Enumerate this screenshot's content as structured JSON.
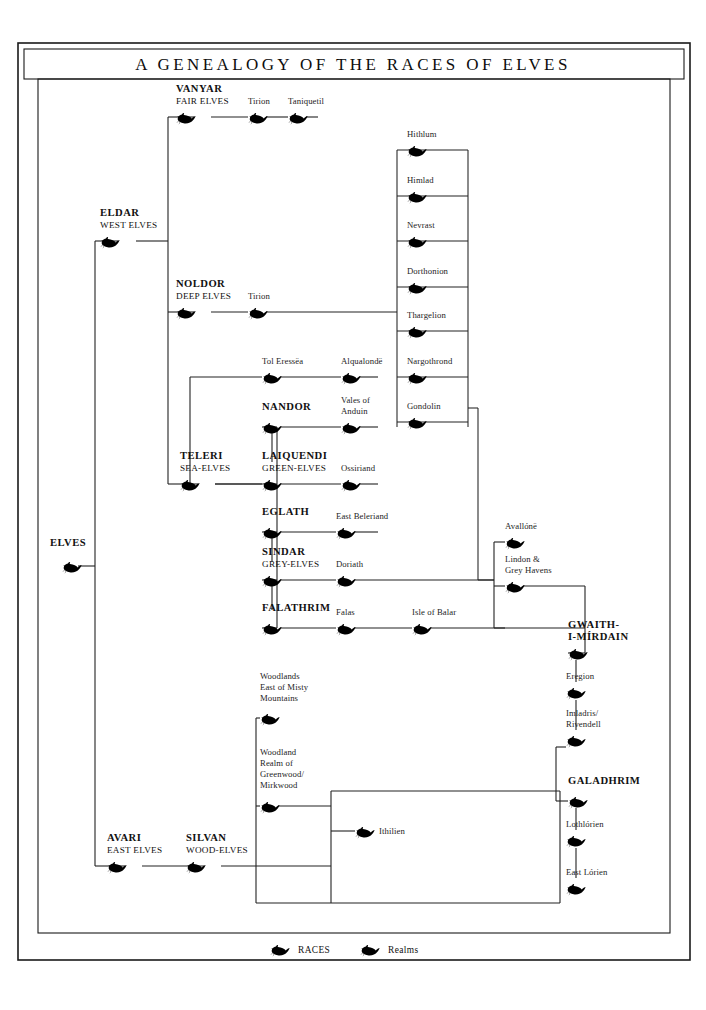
{
  "title": "A GENEALOGY OF THE RACES OF ELVES",
  "legend": {
    "races_label": "RACES",
    "realms_label": "Realms",
    "race_icon": "swan-ship-filled-icon",
    "realm_icon": "swan-ship-outline-icon"
  },
  "colors": {
    "ink": "#111111",
    "line": "#222222",
    "paper": "#ffffff",
    "realm_outline": "#3a3a3a"
  },
  "races": [
    {
      "id": "elves",
      "name": "ELVES",
      "sub": "",
      "x": 62,
      "y": 566,
      "icon": "swan-ship-filled-icon"
    },
    {
      "id": "eldar",
      "name": "ELDAR",
      "sub": "WEST ELVES",
      "x": 100,
      "y": 241,
      "icon": "swan-ship-filled-icon"
    },
    {
      "id": "vanyar",
      "name": "VANYAR",
      "sub": "FAIR ELVES",
      "x": 176,
      "y": 117,
      "icon": "swan-ship-filled-icon"
    },
    {
      "id": "noldor",
      "name": "NOLDOR",
      "sub": "DEEP ELVES",
      "x": 176,
      "y": 312,
      "icon": "swan-ship-filled-icon"
    },
    {
      "id": "teleri",
      "name": "TELERI",
      "sub": "SEA-ELVES",
      "x": 180,
      "y": 484,
      "icon": "swan-ship-filled-icon"
    },
    {
      "id": "nandor",
      "name": "NANDOR",
      "sub": "",
      "x": 262,
      "y": 427,
      "icon": "swan-ship-filled-icon"
    },
    {
      "id": "laiquendi",
      "name": "LAIQUENDI",
      "sub": "GREEN-ELVES",
      "x": 262,
      "y": 484,
      "icon": "swan-ship-filled-icon"
    },
    {
      "id": "eglath",
      "name": "EGLATH",
      "sub": "",
      "x": 262,
      "y": 532,
      "icon": "swan-ship-filled-icon"
    },
    {
      "id": "sindar",
      "name": "SINDAR",
      "sub": "GREY-ELVES",
      "x": 262,
      "y": 580,
      "icon": "swan-ship-filled-icon"
    },
    {
      "id": "falathrim",
      "name": "FALATHRIM",
      "sub": "",
      "x": 262,
      "y": 628,
      "icon": "swan-ship-filled-icon"
    },
    {
      "id": "avari",
      "name": "AVARI",
      "sub": "EAST ELVES",
      "x": 107,
      "y": 866,
      "icon": "swan-ship-filled-icon"
    },
    {
      "id": "silvan",
      "name": "SILVAN",
      "sub": "WOOD-ELVES",
      "x": 186,
      "y": 866,
      "icon": "swan-ship-filled-icon"
    },
    {
      "id": "gwaith",
      "name": "GWAITH-",
      "sub": "I-MÍRDAIN",
      "x": 568,
      "y": 653,
      "icon": "swan-ship-filled-icon",
      "stacked": true
    },
    {
      "id": "galadhrim",
      "name": "GALADHRIM",
      "sub": "",
      "x": 568,
      "y": 801,
      "icon": "swan-ship-filled-icon"
    }
  ],
  "realms": [
    {
      "id": "tirion-v",
      "label": "Tirion",
      "x": 248,
      "y": 117
    },
    {
      "id": "taniquetil",
      "label": "Taniquetil",
      "x": 288,
      "y": 117
    },
    {
      "id": "tirion-n",
      "label": "Tirion",
      "x": 248,
      "y": 312
    },
    {
      "id": "hithlum",
      "label": "Hithlum",
      "x": 407,
      "y": 150
    },
    {
      "id": "himlad",
      "label": "Himlad",
      "x": 407,
      "y": 196
    },
    {
      "id": "nevrast",
      "label": "Nevrast",
      "x": 407,
      "y": 241
    },
    {
      "id": "dorthonion",
      "label": "Dorthonion",
      "x": 407,
      "y": 287
    },
    {
      "id": "thargelion",
      "label": "Thargelion",
      "x": 407,
      "y": 331
    },
    {
      "id": "nargothrond",
      "label": "Nargothrond",
      "x": 407,
      "y": 377
    },
    {
      "id": "gondolin",
      "label": "Gondolin",
      "x": 407,
      "y": 422
    },
    {
      "id": "tol-eressea",
      "label": "Tol Eressëa",
      "x": 262,
      "y": 377
    },
    {
      "id": "alqualonde",
      "label": "Alqualondë",
      "x": 341,
      "y": 377
    },
    {
      "id": "vales-anduin",
      "label": "Vales of\nAnduin",
      "x": 341,
      "y": 427
    },
    {
      "id": "ossiriand",
      "label": "Ossiriand",
      "x": 341,
      "y": 484
    },
    {
      "id": "east-beleriand",
      "label": "East Beleriand",
      "x": 336,
      "y": 532
    },
    {
      "id": "doriath",
      "label": "Doriath",
      "x": 336,
      "y": 580
    },
    {
      "id": "falas",
      "label": "Falas",
      "x": 336,
      "y": 628
    },
    {
      "id": "isle-of-balar",
      "label": "Isle of Balar",
      "x": 412,
      "y": 628
    },
    {
      "id": "avallone",
      "label": "Avallónë",
      "x": 505,
      "y": 542
    },
    {
      "id": "lindon",
      "label": "Lindon &\nGrey Havens",
      "x": 505,
      "y": 586
    },
    {
      "id": "eregion",
      "label": "Eregion",
      "x": 566,
      "y": 692
    },
    {
      "id": "imladris",
      "label": "Imladris/\nRivendell",
      "x": 566,
      "y": 740
    },
    {
      "id": "lothlorien",
      "label": "Lothlórien",
      "x": 566,
      "y": 840
    },
    {
      "id": "east-lorien",
      "label": "East Lórien",
      "x": 566,
      "y": 888
    },
    {
      "id": "woodlands-misty",
      "label": "Woodlands\nEast of Misty\nMountains",
      "x": 260,
      "y": 703
    },
    {
      "id": "greenwood",
      "label": "Woodland\nRealm of\nGreenwood/\nMirkwood",
      "x": 260,
      "y": 791
    },
    {
      "id": "ithilien",
      "label": "Ithilien",
      "x": 355,
      "y": 831
    }
  ]
}
